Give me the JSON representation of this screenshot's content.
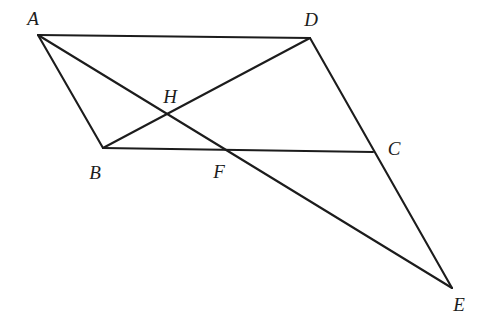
{
  "figure": {
    "type": "plane-geometry-diagram",
    "background_color": "#ffffff",
    "stroke_color": "#1c1c1c",
    "stroke_width": 2.1,
    "canvas": {
      "width": 485,
      "height": 320
    },
    "points": [
      {
        "name": "A",
        "label": "A",
        "x": 38,
        "y": 35,
        "label_x": 33,
        "label_y": 18
      },
      {
        "name": "B",
        "label": "B",
        "x": 103,
        "y": 148,
        "label_x": 95,
        "label_y": 172
      },
      {
        "name": "C",
        "label": "C",
        "x": 373,
        "y": 152,
        "label_x": 394,
        "label_y": 148
      },
      {
        "name": "D",
        "label": "D",
        "x": 310,
        "y": 38,
        "label_x": 311,
        "label_y": 19
      },
      {
        "name": "E",
        "label": "E",
        "x": 452,
        "y": 288,
        "label_x": 459,
        "label_y": 304
      },
      {
        "name": "F",
        "label": "F",
        "x": 222,
        "y": 152,
        "label_x": 219,
        "label_y": 171
      },
      {
        "name": "H",
        "label": "H",
        "x": 168,
        "y": 115,
        "label_x": 170,
        "label_y": 96
      }
    ],
    "segments": [
      {
        "name": "segment-AD",
        "from": "A",
        "to": "D"
      },
      {
        "name": "segment-AB",
        "from": "A",
        "to": "B"
      },
      {
        "name": "segment-BC",
        "from": "B",
        "to": "C"
      },
      {
        "name": "segment-BD",
        "from": "B",
        "to": "D"
      },
      {
        "name": "segment-AE",
        "from": "A",
        "to": "E"
      },
      {
        "name": "segment-DE",
        "from": "D",
        "to": "E"
      }
    ]
  }
}
